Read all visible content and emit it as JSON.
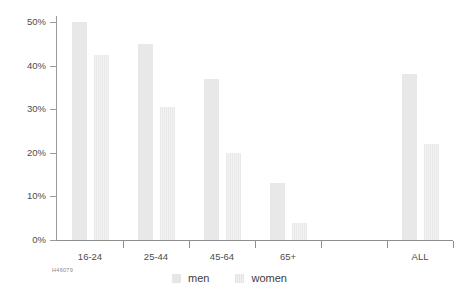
{
  "chart_data": {
    "type": "bar",
    "title": "",
    "subtitle": "",
    "xlabel": "",
    "ylabel": "",
    "ylim": [
      0,
      50
    ],
    "ytick_values": [
      0,
      10,
      20,
      30,
      40,
      50
    ],
    "ytick_labels": [
      "0%",
      "10%",
      "20%",
      "30%",
      "40%",
      "50%"
    ],
    "grid": false,
    "legend_position": "bottom-center",
    "categories": [
      "16-24",
      "25-44",
      "45-64",
      "65+",
      "",
      "ALL"
    ],
    "series": [
      {
        "name": "men",
        "color": "#e8e8e8",
        "values": [
          50,
          45,
          37,
          13,
          null,
          38
        ]
      },
      {
        "name": "women",
        "color": "#ededed",
        "values": [
          42.5,
          30.5,
          20,
          4,
          null,
          22
        ]
      }
    ],
    "annotations": []
  },
  "legend": {
    "items": [
      {
        "label": "men",
        "swatch": "men-swatch"
      },
      {
        "label": "women",
        "swatch": "women-swatch"
      }
    ]
  },
  "footer": {
    "source_code": "H46079"
  }
}
